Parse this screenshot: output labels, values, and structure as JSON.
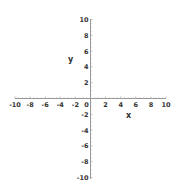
{
  "chart_data": {
    "type": "line",
    "title": "",
    "xlabel": "x",
    "ylabel": "y",
    "xlim": [
      -10,
      10
    ],
    "ylim": [
      -10,
      10
    ],
    "grid": false,
    "legend": null,
    "x_ticks": [
      -10,
      -8,
      -6,
      -4,
      -2,
      0,
      2,
      4,
      6,
      8,
      10
    ],
    "y_ticks": [
      -10,
      -8,
      -6,
      -4,
      -2,
      0,
      2,
      4,
      6,
      8,
      10
    ],
    "x_tick_labels": [
      "-10",
      "-8",
      "-6",
      "-4",
      "-2",
      "0",
      "2",
      "4",
      "6",
      "8",
      "10"
    ],
    "y_tick_labels": [
      "10",
      "8",
      "6",
      "4",
      "2",
      "-2",
      "-4",
      "-6",
      "-8",
      "-10"
    ],
    "series": []
  },
  "colors": {
    "axis": "#999999",
    "text": "#333333",
    "background": "#ffffff"
  }
}
